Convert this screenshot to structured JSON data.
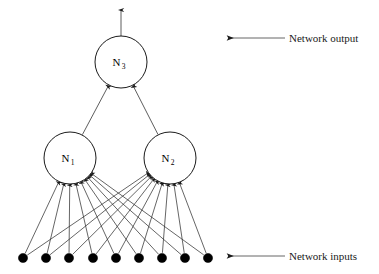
{
  "diagram": {
    "type": "neural-network-diagram",
    "canvas": {
      "width": 379,
      "height": 274
    },
    "colors": {
      "background": "#ffffff",
      "stroke": "#333333",
      "node_fill": "#ffffff",
      "node_stroke": "#000000",
      "input_dot_fill": "#000000",
      "text": "#000000",
      "annotation_line": "#555555"
    },
    "neurons": [
      {
        "id": "N3",
        "label": "N",
        "subscript": "3",
        "cx": 121,
        "cy": 62,
        "r": 26,
        "layer": "output"
      },
      {
        "id": "N1",
        "label": "N",
        "subscript": "1",
        "cx": 70,
        "cy": 158,
        "r": 26,
        "layer": "hidden"
      },
      {
        "id": "N2",
        "label": "N",
        "subscript": "2",
        "cx": 170,
        "cy": 158,
        "r": 26,
        "layer": "hidden"
      }
    ],
    "input_nodes": [
      {
        "index": 1,
        "cx": 23,
        "cy": 258,
        "r": 4.6
      },
      {
        "index": 2,
        "cx": 46,
        "cy": 258,
        "r": 4.6
      },
      {
        "index": 3,
        "cx": 69,
        "cy": 258,
        "r": 4.6
      },
      {
        "index": 4,
        "cx": 93,
        "cy": 258,
        "r": 4.6
      },
      {
        "index": 5,
        "cx": 116,
        "cy": 258,
        "r": 4.6
      },
      {
        "index": 6,
        "cx": 139,
        "cy": 258,
        "r": 4.6
      },
      {
        "index": 7,
        "cx": 162,
        "cy": 258,
        "r": 4.6
      },
      {
        "index": 8,
        "cx": 185,
        "cy": 258,
        "r": 4.6
      },
      {
        "index": 9,
        "cx": 208,
        "cy": 258,
        "r": 4.6
      }
    ],
    "input_count": 9,
    "hidden_count": 2,
    "output_count": 1,
    "connections": {
      "inputs_to_hidden": "fully-connected",
      "hidden_to_output": "fully-connected",
      "output_arrow": {
        "x": 121,
        "y_from": 36,
        "y_to": 10
      }
    },
    "annotations": [
      {
        "id": "network-output",
        "label": "Network output",
        "arrow": {
          "x_tail": 285,
          "x_head": 228,
          "y": 38
        },
        "text_x": 289,
        "text_y": 42
      },
      {
        "id": "network-inputs",
        "label": "Network inputs",
        "arrow": {
          "x_tail": 285,
          "x_head": 228,
          "y": 256
        },
        "text_x": 289,
        "text_y": 260
      }
    ]
  }
}
